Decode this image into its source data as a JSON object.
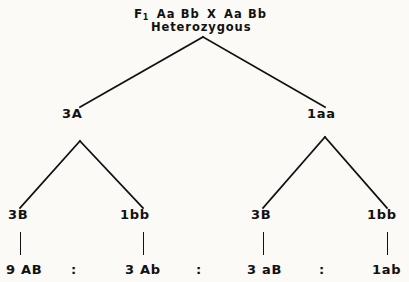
{
  "diagram": {
    "title_line1": {
      "generation": "F",
      "generation_subscript": "1",
      "parent_left": "Aa Bb",
      "cross_symbol": "X",
      "parent_right": "Aa Bb"
    },
    "title_line2": "Heterozygous",
    "level2": [
      {
        "label": "3A",
        "x": 62
      },
      {
        "label": "1aa",
        "x": 307
      }
    ],
    "level3": [
      {
        "label": "3B",
        "x": 8
      },
      {
        "label": "1bb",
        "x": 120
      },
      {
        "label": "3B",
        "x": 251
      },
      {
        "label": "1bb",
        "x": 367
      }
    ],
    "ratio_terms": [
      {
        "label": "9 AB",
        "x": 6
      },
      {
        "label": "3 Ab",
        "x": 125
      },
      {
        "label": "3 aB",
        "x": 247
      },
      {
        "label": "1ab",
        "x": 372
      }
    ],
    "ratio_separators": [
      {
        "label": ":",
        "x": 71
      },
      {
        "label": ":",
        "x": 196
      },
      {
        "label": ":",
        "x": 319
      }
    ],
    "colors": {
      "line": "#111111",
      "text": "#111111",
      "background": "#fbfaf7"
    }
  }
}
